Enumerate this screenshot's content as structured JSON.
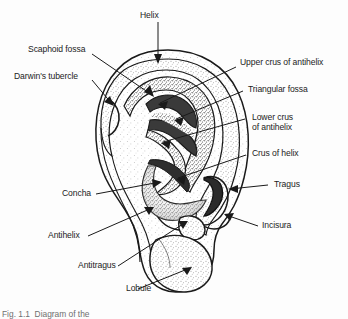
{
  "figure": {
    "caption_partial": "Fig. 1.1  Diagram of the",
    "background_color": "#fdfdfd",
    "ink_color": "#1c1c1c"
  },
  "labels": [
    {
      "id": "helix",
      "text": "Helix"
    },
    {
      "id": "scaphoid-fossa",
      "text": "Scaphoid fossa"
    },
    {
      "id": "darwins-tubercle",
      "text": "Darwin's tubercle"
    },
    {
      "id": "upper-crus",
      "text": "Upper crus of antihelix"
    },
    {
      "id": "triangular-fossa",
      "text": "Triangular fossa"
    },
    {
      "id": "lower-crus-1",
      "text": "Lower crus"
    },
    {
      "id": "lower-crus-2",
      "text": "of antihelix"
    },
    {
      "id": "crus-of-helix",
      "text": "Crus of helix"
    },
    {
      "id": "tragus",
      "text": "Tragus"
    },
    {
      "id": "incisura",
      "text": "Incisura"
    },
    {
      "id": "concha",
      "text": "Concha"
    },
    {
      "id": "antihelix",
      "text": "Antihelix"
    },
    {
      "id": "antitragus",
      "text": "Antitragus"
    },
    {
      "id": "lobule",
      "text": "Lobule"
    }
  ]
}
